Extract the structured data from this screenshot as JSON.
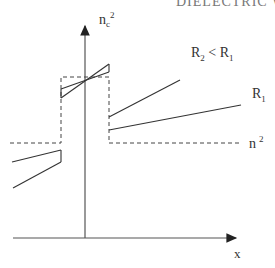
{
  "header": {
    "text": "DIELECTRIC W"
  },
  "axes": {
    "y_label": {
      "base": "n",
      "sub": "c",
      "sup": "2"
    },
    "x_label": "x"
  },
  "labels": {
    "comparison": {
      "a": "R",
      "a_sub": "2",
      "op": " < ",
      "b": "R",
      "b_sub": "1"
    },
    "r1": {
      "base": "R",
      "sub": "1"
    },
    "n2": {
      "base": "n",
      "sup": "2"
    }
  },
  "colors": {
    "line": "#333333",
    "dash": "#444444"
  }
}
